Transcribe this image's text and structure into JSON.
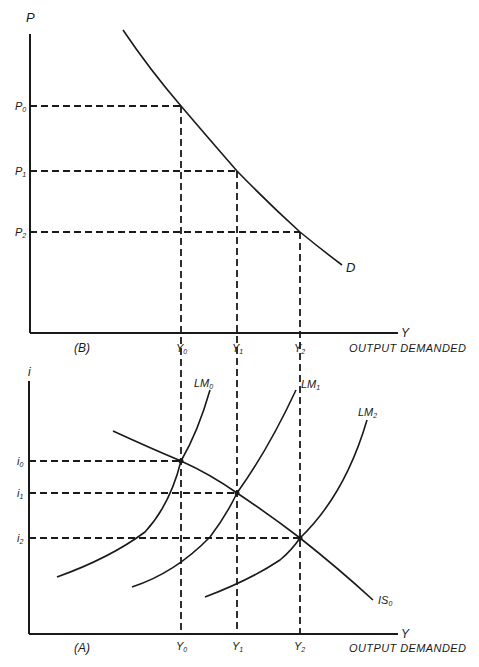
{
  "panel_b": {
    "label": "(B)",
    "y_axis_label": "P",
    "x_axis_label": "Y",
    "x_axis_title": "OUTPUT DEMANDED",
    "curve_label": "D",
    "price_levels": [
      {
        "main": "P",
        "sub": "0"
      },
      {
        "main": "P",
        "sub": "1"
      },
      {
        "main": "P",
        "sub": "2"
      }
    ],
    "output_levels": [
      {
        "main": "Y",
        "sub": "0"
      },
      {
        "main": "Y",
        "sub": "1"
      },
      {
        "main": "Y",
        "sub": "2"
      }
    ]
  },
  "panel_a": {
    "label": "(A)",
    "y_axis_label": "i",
    "x_axis_label": "Y",
    "x_axis_title": "OUTPUT DEMANDED",
    "is_curve": {
      "main": "IS",
      "sub": "0"
    },
    "lm_curves": [
      {
        "main": "LM",
        "sub": "0"
      },
      {
        "main": "LM",
        "sub": "1"
      },
      {
        "main": "LM",
        "sub": "2"
      }
    ],
    "interest_levels": [
      {
        "main": "i",
        "sub": "0"
      },
      {
        "main": "i",
        "sub": "1"
      },
      {
        "main": "i",
        "sub": "2"
      }
    ],
    "output_levels": [
      {
        "main": "Y",
        "sub": "0"
      },
      {
        "main": "Y",
        "sub": "1"
      },
      {
        "main": "Y",
        "sub": "2"
      }
    ]
  },
  "colors": {
    "ink": "#1a1a1a",
    "background": "#ffffff"
  }
}
